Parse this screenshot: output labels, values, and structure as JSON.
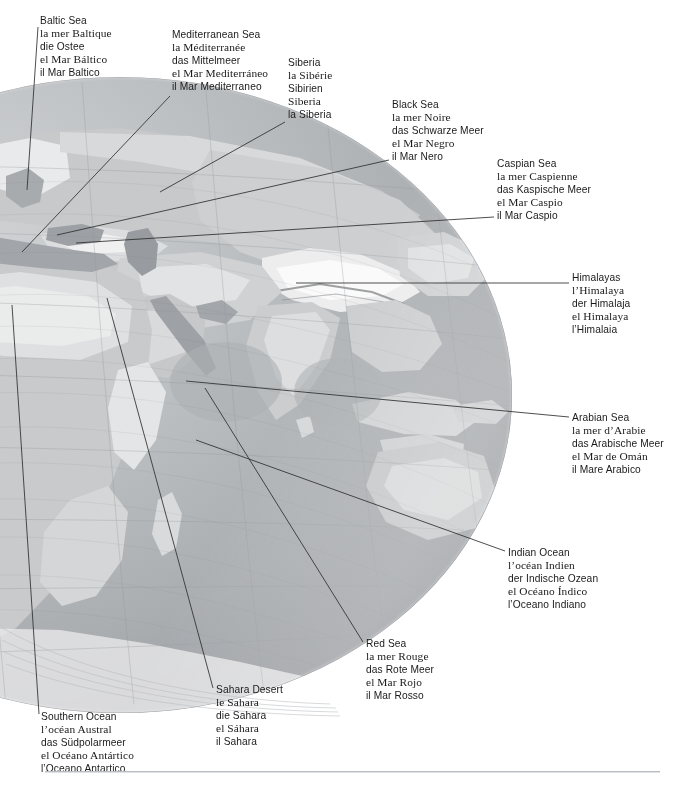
{
  "page": {
    "background_color": "#ffffff",
    "text_color": "#1a1a1a",
    "rule_color": "#b9bcc1"
  },
  "globe": {
    "name": "shaded-relief-globe",
    "description": "Grayscale shaded relief globe centered on the Indian Ocean showing Europe, Africa, Asia and Australia",
    "ocean_color": "#b0b2b5",
    "land_color": "#c9cbcd",
    "highland_color": "#f2f2f2",
    "outline_color": "#8e9194",
    "graticule_color": "#9a9da0",
    "center_x": 120,
    "center_y": 395,
    "radius_x": 392,
    "radius_y": 318
  },
  "labels": [
    {
      "id": "baltic-sea",
      "x": 40,
      "y": 14,
      "lines": [
        {
          "lang": "en",
          "text": "Baltic Sea"
        },
        {
          "lang": "fr",
          "text": "la mer Baltique"
        },
        {
          "lang": "de",
          "text": "die Ostee"
        },
        {
          "lang": "es",
          "text": "el Mar Báltico"
        },
        {
          "lang": "it",
          "text": "il Mar Baltico"
        }
      ],
      "leader": [
        [
          38,
          27
        ],
        [
          27,
          190
        ]
      ]
    },
    {
      "id": "mediterranean-sea",
      "x": 172,
      "y": 28,
      "lines": [
        {
          "lang": "en",
          "text": "Mediterranean Sea"
        },
        {
          "lang": "fr",
          "text": "la Méditerranée"
        },
        {
          "lang": "de",
          "text": "das Mittelmeer"
        },
        {
          "lang": "es",
          "text": "el Mar Mediterráneo"
        },
        {
          "lang": "it",
          "text": "il Mar Mediterraneo"
        }
      ],
      "leader": [
        [
          170,
          96
        ],
        [
          22,
          252
        ]
      ]
    },
    {
      "id": "siberia",
      "x": 288,
      "y": 56,
      "lines": [
        {
          "lang": "en",
          "text": "Siberia"
        },
        {
          "lang": "fr",
          "text": "la Sibérie"
        },
        {
          "lang": "de",
          "text": "Sibirien"
        },
        {
          "lang": "es",
          "text": "Siberia"
        },
        {
          "lang": "it",
          "text": "la Siberia"
        }
      ],
      "leader": [
        [
          285,
          122
        ],
        [
          160,
          192
        ]
      ]
    },
    {
      "id": "black-sea",
      "x": 392,
      "y": 98,
      "lines": [
        {
          "lang": "en",
          "text": "Black Sea"
        },
        {
          "lang": "fr",
          "text": "la mer Noire"
        },
        {
          "lang": "de",
          "text": "das Schwarze Meer"
        },
        {
          "lang": "es",
          "text": "el Mar Negro"
        },
        {
          "lang": "it",
          "text": "il Mar Nero"
        }
      ],
      "leader": [
        [
          389,
          160
        ],
        [
          57,
          235
        ]
      ]
    },
    {
      "id": "caspian-sea",
      "x": 497,
      "y": 157,
      "lines": [
        {
          "lang": "en",
          "text": "Caspian Sea"
        },
        {
          "lang": "fr",
          "text": "la mer Caspienne"
        },
        {
          "lang": "de",
          "text": "das Kaspische Meer"
        },
        {
          "lang": "es",
          "text": "el Mar Caspio"
        },
        {
          "lang": "it",
          "text": "il Mar Caspio"
        }
      ],
      "leader": [
        [
          494,
          217
        ],
        [
          76,
          243
        ]
      ]
    },
    {
      "id": "himalayas",
      "x": 572,
      "y": 271,
      "lines": [
        {
          "lang": "en",
          "text": "Himalayas"
        },
        {
          "lang": "fr",
          "text": "l’Himalaya"
        },
        {
          "lang": "de",
          "text": "der Himalaja"
        },
        {
          "lang": "es",
          "text": "el Himalaya"
        },
        {
          "lang": "it",
          "text": "l’Himalaia"
        }
      ],
      "leader": [
        [
          569,
          283
        ],
        [
          296,
          283
        ]
      ]
    },
    {
      "id": "arabian-sea",
      "x": 572,
      "y": 411,
      "lines": [
        {
          "lang": "en",
          "text": "Arabian Sea"
        },
        {
          "lang": "fr",
          "text": "la mer d’Arabie"
        },
        {
          "lang": "de",
          "text": "das Arabische Meer"
        },
        {
          "lang": "es",
          "text": "el Mar de Omán"
        },
        {
          "lang": "it",
          "text": "il Mare Arabico"
        }
      ],
      "leader": [
        [
          569,
          417
        ],
        [
          186,
          381
        ]
      ]
    },
    {
      "id": "indian-ocean",
      "x": 508,
      "y": 546,
      "lines": [
        {
          "lang": "en",
          "text": "Indian Ocean"
        },
        {
          "lang": "fr",
          "text": "l’océan Indien"
        },
        {
          "lang": "de",
          "text": "der Indische Ozean"
        },
        {
          "lang": "es",
          "text": "el Océano Índico"
        },
        {
          "lang": "it",
          "text": "l’Oceano Indiano"
        }
      ],
      "leader": [
        [
          505,
          551
        ],
        [
          196,
          440
        ]
      ]
    },
    {
      "id": "red-sea",
      "x": 366,
      "y": 637,
      "lines": [
        {
          "lang": "en",
          "text": "Red Sea"
        },
        {
          "lang": "fr",
          "text": "la mer Rouge"
        },
        {
          "lang": "de",
          "text": "das Rote Meer"
        },
        {
          "lang": "es",
          "text": "el Mar Rojo"
        },
        {
          "lang": "it",
          "text": "il Mar Rosso"
        }
      ],
      "leader": [
        [
          363,
          642
        ],
        [
          205,
          388
        ]
      ]
    },
    {
      "id": "sahara-desert",
      "x": 216,
      "y": 683,
      "lines": [
        {
          "lang": "en",
          "text": "Sahara Desert"
        },
        {
          "lang": "fr",
          "text": "le Sahara"
        },
        {
          "lang": "de",
          "text": "die Sahara"
        },
        {
          "lang": "es",
          "text": "el Sáhara"
        },
        {
          "lang": "it",
          "text": "il Sahara"
        }
      ],
      "leader": [
        [
          213,
          688
        ],
        [
          107,
          298
        ]
      ]
    },
    {
      "id": "southern-ocean",
      "x": 41,
      "y": 710,
      "lines": [
        {
          "lang": "en",
          "text": "Southern Ocean"
        },
        {
          "lang": "fr",
          "text": "l’océan Austral"
        },
        {
          "lang": "de",
          "text": "das Südpolarmeer"
        },
        {
          "lang": "es",
          "text": "el Océano Antártico"
        },
        {
          "lang": "it",
          "text": "l’Oceano Antartico"
        }
      ],
      "leader": [
        [
          39,
          714
        ],
        [
          12,
          305
        ]
      ]
    }
  ]
}
